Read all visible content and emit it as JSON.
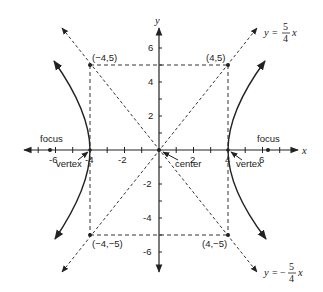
{
  "diagram": {
    "axes": {
      "x_label": "x",
      "y_label": "y",
      "x_ticks": [
        "-6",
        "-2",
        "2",
        "6"
      ],
      "x_ticks_special": [
        "-4",
        "4"
      ],
      "y_ticks": [
        "6",
        "4",
        "2",
        "-2",
        "-4",
        "-6"
      ]
    },
    "points": {
      "top_left": "(−4,5)",
      "top_right": "(4,5)",
      "bottom_left": "(−4,−5)",
      "bottom_right": "(4,−5)"
    },
    "labels": {
      "focus_left": "focus",
      "focus_right": "focus",
      "vertex_left": "vertex",
      "vertex_right": "vertex",
      "center": "center"
    },
    "asymptotes": {
      "positive": {
        "lhs": "y",
        "eq": "=",
        "sign": "",
        "num": "5",
        "den": "4",
        "var": "x"
      },
      "negative": {
        "lhs": "y",
        "eq": "=",
        "sign": "−",
        "num": "5",
        "den": "4",
        "var": "x"
      }
    }
  }
}
